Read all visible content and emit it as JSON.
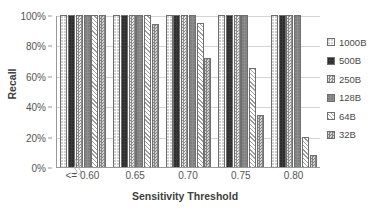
{
  "chart_data": {
    "type": "bar",
    "title": "",
    "xlabel": "Sensitivity Threshold",
    "ylabel": "Recall",
    "categories": [
      "<= 0.60",
      "0.65",
      "0.70",
      "0.75",
      "0.80"
    ],
    "ylim": [
      0,
      100
    ],
    "y_ticks": [
      "0%",
      "20%",
      "40%",
      "60%",
      "80%",
      "100%"
    ],
    "y_tick_values": [
      0,
      20,
      40,
      60,
      80,
      100
    ],
    "grid": true,
    "legend_position": "right",
    "x_axis_break": true,
    "series": [
      {
        "name": "1000B",
        "pattern": "dotted-light",
        "values": [
          100,
          100,
          100,
          100,
          100
        ]
      },
      {
        "name": "500B",
        "pattern": "solid-dark",
        "values": [
          100,
          100,
          100,
          100,
          100
        ]
      },
      {
        "name": "250B",
        "pattern": "checker-light",
        "values": [
          100,
          100,
          100,
          100,
          100
        ]
      },
      {
        "name": "128B",
        "pattern": "solid-gray",
        "values": [
          100,
          100,
          100,
          100,
          100
        ]
      },
      {
        "name": "64B",
        "pattern": "diagonal-hatch",
        "values": [
          100,
          100,
          95,
          65,
          20
        ]
      },
      {
        "name": "32B",
        "pattern": "checker-gray",
        "values": [
          100,
          94,
          72,
          34,
          8
        ]
      }
    ]
  }
}
